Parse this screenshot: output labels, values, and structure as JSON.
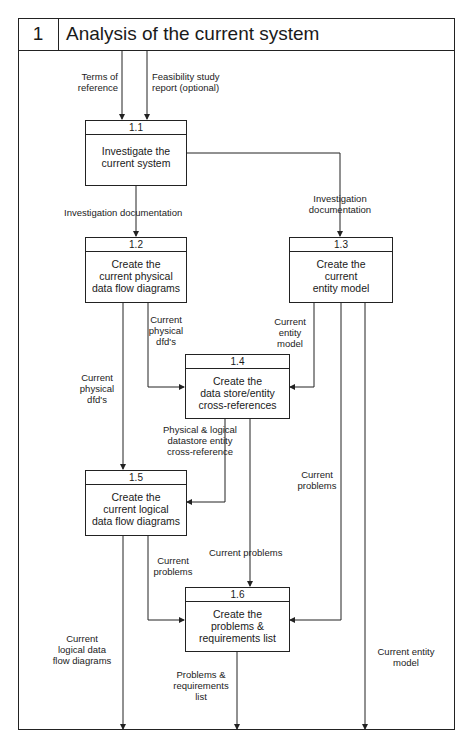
{
  "header": {
    "number": "1",
    "title": "Analysis of the current system"
  },
  "processes": [
    {
      "id": "1.1",
      "label": "Investigate the\ncurrent system"
    },
    {
      "id": "1.2",
      "label": "Create the\ncurrent physical\ndata flow diagrams"
    },
    {
      "id": "1.3",
      "label": "Create the\ncurrent\nentity model"
    },
    {
      "id": "1.4",
      "label": "Create the\ndata store/entity\ncross-references"
    },
    {
      "id": "1.5",
      "label": "Create the\ncurrent logical\ndata flow diagrams"
    },
    {
      "id": "1.6",
      "label": "Create the\nproblems &\nrequirements list"
    }
  ],
  "flows": {
    "terms_of_reference": "Terms of\nreference",
    "feasibility_report": "Feasibility study\nreport (optional)",
    "investigation_doc_left": "Investigation documentation",
    "investigation_doc_right": "Investigation\ndocumentation",
    "current_physical_dfds_to_14": "Current\nphysical\ndfd's",
    "current_entity_model_to_14": "Current\nentity\nmodel",
    "current_physical_dfds_to_15": "Current\nphysical\ndfd's",
    "cross_reference_to_15": "Physical & logical\ndatastore entity\ncross-reference",
    "current_problems_13": "Current\nproblems",
    "current_problems_14": "Current problems",
    "current_problems_15": "Current\nproblems",
    "current_logical_dfds_out": "Current\nlogical data\nflow diagrams",
    "problems_requirements_out": "Problems &\nrequirements\nlist",
    "current_entity_model_out": "Current entity\nmodel"
  },
  "colors": {
    "line": "#222222",
    "background": "#ffffff"
  }
}
